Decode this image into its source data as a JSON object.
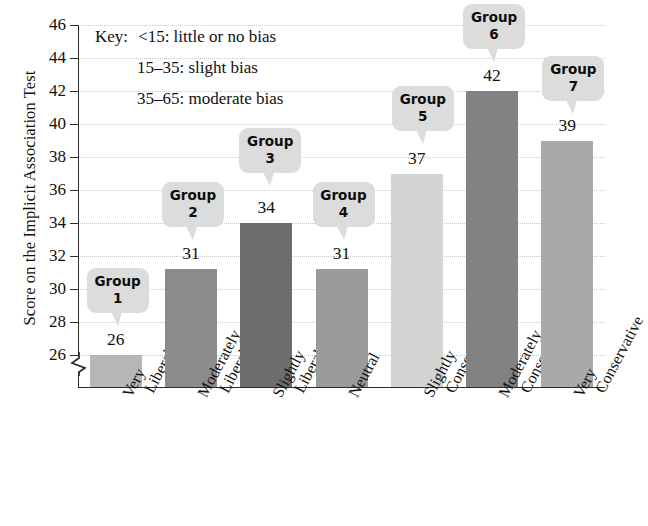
{
  "chart_data": {
    "type": "bar",
    "title": "",
    "xlabel": "",
    "ylabel": "Score on the Implicit Association Test",
    "ylim": [
      26,
      46
    ],
    "ytick_step": 2,
    "grid": true,
    "axis_break": true,
    "legend": "none",
    "categories": [
      "Very Liberal",
      "Moderately Liberal",
      "Slightly Liberal",
      "Neutral",
      "Slightly Conservative",
      "Moderately Conservative",
      "Very Conservative"
    ],
    "values": [
      26,
      31,
      34,
      31,
      37,
      42,
      39
    ],
    "value_labels": [
      "26",
      "31",
      "34",
      "31",
      "37",
      "42",
      "39"
    ],
    "bar_colors": [
      "#b6b6b6",
      "#8c8c8c",
      "#6d6d6d",
      "#9b9b9b",
      "#d4d4d4",
      "#828282",
      "#a9a9a9"
    ],
    "point_labels": [
      "Group 1",
      "Group 2",
      "Group 3",
      "Group 4",
      "Group 5",
      "Group 6",
      "Group 7"
    ],
    "ytick_labels": [
      "46",
      "44",
      "42",
      "40",
      "38",
      "36",
      "34",
      "32",
      "30",
      "28",
      "26"
    ]
  },
  "axis": {
    "y_title": "Score on the Implicit Association Test",
    "ticks": [
      "46",
      "44",
      "42",
      "40",
      "38",
      "36",
      "34",
      "32",
      "30",
      "28",
      "26"
    ]
  },
  "key": {
    "label": "Key:",
    "lines": [
      "<15: little or no bias",
      "15–35: slight bias",
      "35–65: moderate bias"
    ]
  },
  "bars": [
    {
      "category_line1": "Very",
      "category_line2": "Liberal",
      "value": "26",
      "group_word": "Group",
      "group_num": "1"
    },
    {
      "category_line1": "Moderately",
      "category_line2": "Liberal",
      "value": "31",
      "group_word": "Group",
      "group_num": "2"
    },
    {
      "category_line1": "Slightly",
      "category_line2": "Liberal",
      "value": "34",
      "group_word": "Group",
      "group_num": "3"
    },
    {
      "category_line1": "Neutral",
      "category_line2": "",
      "value": "31",
      "group_word": "Group",
      "group_num": "4"
    },
    {
      "category_line1": "Slightly",
      "category_line2": "Conservative",
      "value": "37",
      "group_word": "Group",
      "group_num": "5"
    },
    {
      "category_line1": "Moderately",
      "category_line2": "Conservative",
      "value": "42",
      "group_word": "Group",
      "group_num": "6"
    },
    {
      "category_line1": "Very",
      "category_line2": "Conservative",
      "value": "39",
      "group_word": "Group",
      "group_num": "7"
    }
  ]
}
